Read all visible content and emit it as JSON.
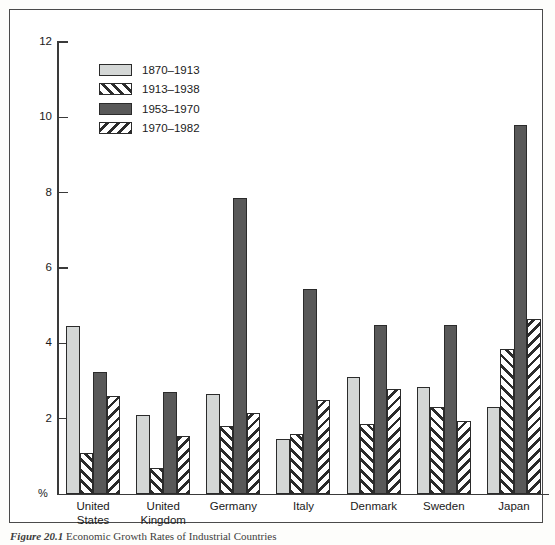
{
  "figure": {
    "caption_label": "Figure 20.1",
    "caption_text": "Economic Growth Rates of Industrial Countries"
  },
  "axes": {
    "y_unit_label": "%",
    "y_ticks": [
      0,
      2,
      4,
      6,
      8,
      10,
      12
    ],
    "y_tick_labels": [
      "",
      "2",
      "4",
      "6",
      "8",
      "10",
      "12"
    ],
    "ylim": [
      0,
      12
    ]
  },
  "legend": {
    "entries": [
      {
        "label": "1870–1913",
        "style": "fill-light",
        "swatch_name": "legend-swatch-1870-1913"
      },
      {
        "label": "1913–1938",
        "style": "fill-hatchf",
        "swatch_name": "legend-swatch-1913-1938"
      },
      {
        "label": "1953–1970",
        "style": "fill-dark",
        "swatch_name": "legend-swatch-1953-1970"
      },
      {
        "label": "1970–1982",
        "style": "fill-hatchb",
        "swatch_name": "legend-swatch-1970-1982"
      }
    ]
  },
  "colors": {
    "series_light": "#d4d7d6",
    "series_dark": "#595959",
    "hatch_ink": "#2b2b2b",
    "axis": "#3a3a3a",
    "frame": "#4a4a4a",
    "background": "#ffffff"
  },
  "chart_data": {
    "type": "bar",
    "title": "",
    "xlabel": "",
    "ylabel": "%",
    "ylim": [
      0,
      12
    ],
    "grid": false,
    "legend_position": "upper-left-inside",
    "categories": [
      "United States",
      "United Kingdom",
      "Germany",
      "Italy",
      "Denmark",
      "Sweden",
      "Japan"
    ],
    "category_lines": [
      [
        "United",
        "States"
      ],
      [
        "United",
        "Kingdom"
      ],
      [
        "Germany"
      ],
      [
        "Italy"
      ],
      [
        "Denmark"
      ],
      [
        "Sweden"
      ],
      [
        "Japan"
      ]
    ],
    "series": [
      {
        "name": "1870–1913",
        "values": [
          4.45,
          2.1,
          2.65,
          1.45,
          3.1,
          2.85,
          2.3
        ]
      },
      {
        "name": "1913–1938",
        "values": [
          1.1,
          0.7,
          1.8,
          1.6,
          1.85,
          2.3,
          3.85
        ]
      },
      {
        "name": "1953–1970",
        "values": [
          3.25,
          2.7,
          7.85,
          5.45,
          4.5,
          4.5,
          9.8
        ]
      },
      {
        "name": "1970–1982",
        "values": [
          2.6,
          1.55,
          2.15,
          2.5,
          2.8,
          1.95,
          4.65
        ]
      }
    ]
  }
}
